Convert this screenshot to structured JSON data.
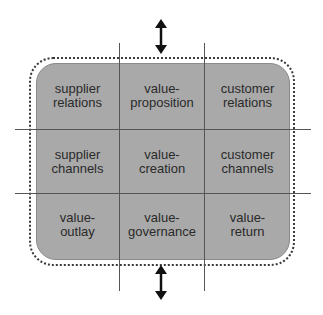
{
  "diagram": {
    "colors": {
      "fill": "#a9a9a9",
      "lines": "#555555",
      "text": "#2a2a2a",
      "background": "#ffffff"
    },
    "cells": [
      {
        "row": 0,
        "col": 0,
        "line1": "supplier",
        "line2": "relations"
      },
      {
        "row": 0,
        "col": 1,
        "line1": "value-",
        "line2": "proposition"
      },
      {
        "row": 0,
        "col": 2,
        "line1": "customer",
        "line2": "relations"
      },
      {
        "row": 1,
        "col": 0,
        "line1": "supplier",
        "line2": "channels"
      },
      {
        "row": 1,
        "col": 1,
        "line1": "value-",
        "line2": "creation"
      },
      {
        "row": 1,
        "col": 2,
        "line1": "customer",
        "line2": "channels"
      },
      {
        "row": 2,
        "col": 0,
        "line1": "value-",
        "line2": "outlay"
      },
      {
        "row": 2,
        "col": 1,
        "line1": "value-",
        "line2": "governance"
      },
      {
        "row": 2,
        "col": 2,
        "line1": "value-",
        "line2": "return"
      }
    ],
    "arrows": [
      {
        "position": "top",
        "icon": "double-vertical-arrow"
      },
      {
        "position": "bottom",
        "icon": "double-vertical-arrow"
      }
    ]
  }
}
